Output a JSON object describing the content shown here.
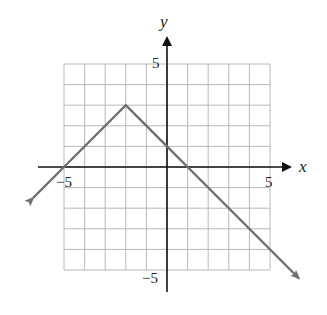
{
  "chart_data": {
    "type": "line",
    "title": "",
    "xlabel": "x",
    "ylabel": "y",
    "xlim": [
      -5,
      5
    ],
    "ylim": [
      -5,
      5
    ],
    "grid": true,
    "x_ticks_labeled": [
      "-5",
      "5"
    ],
    "y_ticks_labeled": [
      "5",
      "-5"
    ],
    "series": [
      {
        "name": "absolute value graph",
        "description": "y = -|x + 2| + 3",
        "points": [
          [
            -6.5,
            -1.5
          ],
          [
            -5,
            0
          ],
          [
            -2,
            3
          ],
          [
            0,
            1
          ],
          [
            1,
            0
          ],
          [
            6.4,
            -5.4
          ]
        ],
        "vertex": [
          -2,
          3
        ],
        "arrows_at_ends": true,
        "color": "#707070"
      }
    ]
  },
  "labels": {
    "x_axis": "x",
    "y_axis": "y",
    "x_min": "−5",
    "x_max": "5",
    "y_max": "5",
    "y_min": "−5"
  },
  "colors": {
    "grid": "#b8b8b8",
    "axis": "#111111",
    "line": "#707070"
  }
}
